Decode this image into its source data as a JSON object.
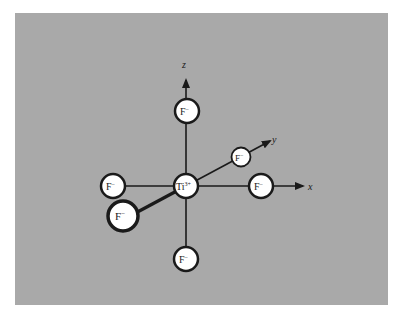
{
  "diagram": {
    "center": {
      "label": "Ti",
      "charge": "3+"
    },
    "ligands": [
      {
        "id": "top",
        "label": "F",
        "charge": "−"
      },
      {
        "id": "bottom",
        "label": "F",
        "charge": "−"
      },
      {
        "id": "left",
        "label": "F",
        "charge": "−"
      },
      {
        "id": "right",
        "label": "F",
        "charge": "−"
      },
      {
        "id": "back",
        "label": "F",
        "charge": "−"
      },
      {
        "id": "front",
        "label": "F",
        "charge": "−"
      }
    ],
    "axes": {
      "x": "x",
      "y": "y",
      "z": "z"
    },
    "colors": {
      "background": "#a9a9a9",
      "atom_fill": "#ffffff",
      "line": "#1a1a1a"
    }
  }
}
